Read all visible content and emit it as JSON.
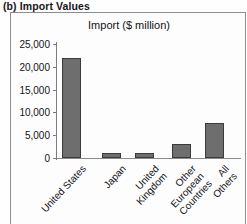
{
  "caption": "(b) Import Values",
  "chart_data": {
    "type": "bar",
    "title": "Import ($ million)",
    "xlabel": "",
    "ylabel": "",
    "ylim": [
      0,
      25000
    ],
    "yticks": [
      "0",
      "5,000",
      "10,000",
      "15,000",
      "20,000",
      "25,000"
    ],
    "ytick_values": [
      0,
      5000,
      10000,
      15000,
      20000,
      25000
    ],
    "grid": false,
    "legend": false,
    "categories": [
      "United States",
      "Japan",
      "United\nKingdom",
      "Other\nEuropean\nCountries",
      "All\nOthers"
    ],
    "values": [
      22000,
      1200,
      1200,
      3100,
      7600
    ],
    "bar_color": "#6e6e6e",
    "bar_edge_color": "#3b3b3b"
  }
}
